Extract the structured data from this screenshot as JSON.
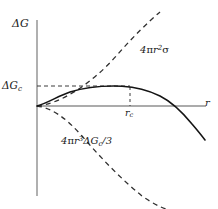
{
  "figure": {
    "background": "#ffffff",
    "axis_color": "#8a8a8a",
    "curve_color": "#1a1a1a",
    "dash_color": "#3a3a3a"
  },
  "axes": {
    "y_label": "ΔG",
    "y_label_delta": "Δ",
    "y_label_var": "G",
    "x_label": "r"
  },
  "annotations": {
    "critical_energy": {
      "delta": "Δ",
      "var": "G",
      "sub": "c",
      "full": "ΔG c"
    },
    "critical_radius": {
      "var": "r",
      "sub": "c",
      "full": "r c"
    },
    "surface_term": {
      "coef": "4",
      "pi": "π",
      "var": "r",
      "sup": "2",
      "sigma": "σ",
      "full": "4πr²σ"
    },
    "volume_term": {
      "coef": "4",
      "pi": "π",
      "var": "r",
      "sup": "3",
      "delta": "Δ",
      "gvar": "G",
      "sub": "c",
      "divisor": "/3",
      "full": "4πr³ΔGc/3"
    }
  },
  "chart_data": {
    "type": "line",
    "title": "",
    "xlabel": "r",
    "ylabel": "ΔG",
    "grid": false,
    "legend": "none",
    "xlim": [
      0,
      1.18
    ],
    "ylim": [
      -1.55,
      1.4
    ],
    "origin_px": [
      37,
      106
    ],
    "annotations": [
      {
        "text": "4πr²σ",
        "role": "surface-energy-curve-label"
      },
      {
        "text": "4πr³ΔGc/3",
        "role": "volume-energy-curve-label"
      },
      {
        "text": "ΔGc",
        "role": "critical-free-energy-tick"
      },
      {
        "text": "rc",
        "role": "critical-radius-tick"
      }
    ],
    "guides": [
      {
        "name": "critical-energy-guide",
        "type": "horizontal-dashed",
        "y_value": 0.265,
        "x_from": 0,
        "x_to": 0.625
      },
      {
        "name": "critical-radius-guide",
        "type": "vertical-dashed",
        "x_value": 0.625,
        "y_from": 0,
        "y_to": 0.265
      }
    ],
    "series": [
      {
        "name": "total free energy",
        "style": "solid",
        "color": "#1a1a1a",
        "x": [
          0.0,
          0.05,
          0.1,
          0.15,
          0.2,
          0.25,
          0.3,
          0.35,
          0.4,
          0.45,
          0.5,
          0.55,
          0.6,
          0.625,
          0.65,
          0.7,
          0.75,
          0.8,
          0.85,
          0.88,
          0.9,
          0.95,
          1.0,
          1.05,
          1.1
        ],
        "y": [
          0.0,
          0.019,
          0.06,
          0.104,
          0.146,
          0.183,
          0.214,
          0.238,
          0.254,
          0.263,
          0.266,
          0.265,
          0.262,
          0.26,
          0.256,
          0.239,
          0.213,
          0.176,
          0.118,
          0.072,
          0.04,
          -0.06,
          -0.19,
          -0.35,
          -0.54
        ]
      },
      {
        "name": "surface energy term",
        "style": "dashed",
        "color": "#3a3a3a",
        "x": [
          0.0,
          0.1,
          0.2,
          0.3,
          0.4,
          0.5,
          0.6,
          0.7,
          0.75,
          0.8
        ],
        "y": [
          0.0,
          0.022,
          0.088,
          0.198,
          0.352,
          0.55,
          0.792,
          1.078,
          1.238,
          1.408
        ]
      },
      {
        "name": "volume energy term",
        "style": "dashed",
        "color": "#3a3a3a",
        "x": [
          0.0,
          0.1,
          0.2,
          0.3,
          0.4,
          0.5,
          0.6,
          0.7,
          0.8,
          0.9,
          1.0,
          1.05
        ],
        "y": [
          0.0,
          -0.004,
          -0.032,
          -0.108,
          -0.256,
          -0.5,
          -0.72,
          -0.94,
          -1.16,
          -1.34,
          -1.48,
          -1.54
        ]
      }
    ]
  }
}
